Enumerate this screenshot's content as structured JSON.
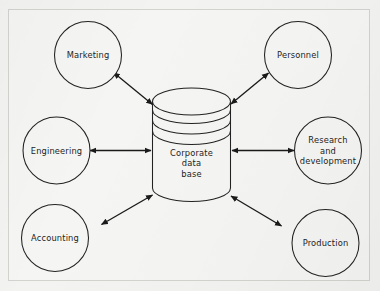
{
  "figure": {
    "background_color": "#f3f3f1",
    "frame_color": "#d2d2cf",
    "ink_color": "#1d1d1d"
  },
  "center": {
    "shape": "database-cylinder",
    "label_lines": [
      "Corporate",
      "data",
      "base"
    ],
    "line1": "Corporate",
    "line2": "data",
    "line3": "base",
    "disc_bands": 3
  },
  "nodes": [
    {
      "id": "marketing",
      "label": "Marketing",
      "position": "top-left",
      "lines": [
        "Marketing"
      ]
    },
    {
      "id": "personnel",
      "label": "Personnel",
      "position": "top-right",
      "lines": [
        "Personnel"
      ]
    },
    {
      "id": "engineering",
      "label": "Engineering",
      "position": "middle-left",
      "lines": [
        "Engineering"
      ]
    },
    {
      "id": "research",
      "label": "Research and development",
      "position": "middle-right",
      "lines": [
        "Research",
        "and",
        "development"
      ]
    },
    {
      "id": "accounting",
      "label": "Accounting",
      "position": "bottom-left",
      "lines": [
        "Accounting"
      ]
    },
    {
      "id": "production",
      "label": "Production",
      "position": "bottom-right",
      "lines": [
        "Production"
      ]
    }
  ],
  "node_text": {
    "marketing": "Marketing",
    "personnel": "Personnel",
    "engineering": "Engineering",
    "research_l1": "Research",
    "research_l2": "and",
    "research_l3": "development",
    "accounting": "Accounting",
    "production": "Production"
  },
  "connectors": [
    {
      "id": "marketing-db",
      "from": "marketing",
      "to": "center",
      "arrow": "double-headed"
    },
    {
      "id": "personnel-db",
      "from": "personnel",
      "to": "center",
      "arrow": "double-headed"
    },
    {
      "id": "engineering-db",
      "from": "engineering",
      "to": "center",
      "arrow": "double-headed"
    },
    {
      "id": "research-db",
      "from": "research",
      "to": "center",
      "arrow": "double-headed"
    },
    {
      "id": "accounting-db",
      "from": "accounting",
      "to": "center",
      "arrow": "double-headed"
    },
    {
      "id": "production-db",
      "from": "production",
      "to": "center",
      "arrow": "double-headed"
    }
  ]
}
